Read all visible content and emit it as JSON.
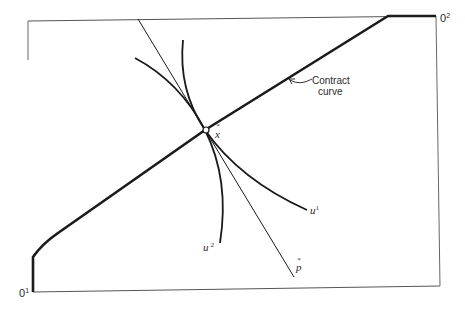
{
  "figure": {
    "type": "Edgeworth box",
    "origins": {
      "agent1": {
        "label": "0",
        "sup": "1"
      },
      "agent2": {
        "label": "0",
        "sup": "2"
      }
    },
    "contract_curve": {
      "label_line1": "Contract",
      "label_line2": "curve"
    },
    "equilibrium_point": {
      "label": "x",
      "accent": "*"
    },
    "price_line": {
      "label": "p",
      "accent": "*"
    },
    "indifference_curves": [
      {
        "label": "u",
        "sup": "1"
      },
      {
        "label": "u",
        "sup": "2"
      }
    ]
  },
  "colors": {
    "ink": "#1a1a1a",
    "box": "#555555",
    "background": "#ffffff"
  }
}
